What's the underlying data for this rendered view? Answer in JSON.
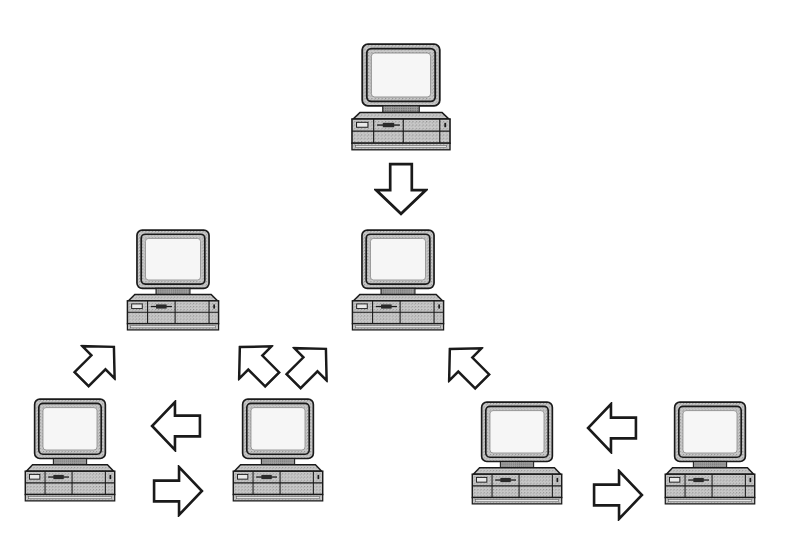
{
  "diagram": {
    "type": "hierarchical-network",
    "colors": {
      "stroke": "#1a1a1a",
      "casing": "#b8b8b8",
      "casing_dark": "#8c8c8c",
      "screen": "#f4f4f4",
      "background": "#ffffff"
    },
    "nodes": [
      {
        "id": "top",
        "x": 344,
        "y": 42,
        "w": 114,
        "h": 110,
        "icon": "computer-icon"
      },
      {
        "id": "mid-left",
        "x": 120,
        "y": 228,
        "w": 106,
        "h": 104,
        "icon": "computer-icon"
      },
      {
        "id": "mid-center",
        "x": 345,
        "y": 228,
        "w": 106,
        "h": 104,
        "icon": "computer-icon"
      },
      {
        "id": "bot-1",
        "x": 18,
        "y": 397,
        "w": 104,
        "h": 106,
        "icon": "computer-icon"
      },
      {
        "id": "bot-2",
        "x": 226,
        "y": 397,
        "w": 104,
        "h": 106,
        "icon": "computer-icon"
      },
      {
        "id": "bot-3",
        "x": 465,
        "y": 400,
        "w": 104,
        "h": 106,
        "icon": "computer-icon"
      },
      {
        "id": "bot-4",
        "x": 658,
        "y": 400,
        "w": 104,
        "h": 106,
        "icon": "computer-icon"
      }
    ],
    "arrows": [
      {
        "id": "top-to-mid-center",
        "direction": "down",
        "x": 372,
        "y": 162,
        "w": 58,
        "h": 54
      },
      {
        "id": "bot1-to-mid-left",
        "direction": "up-right",
        "x": 70,
        "y": 338,
        "w": 56,
        "h": 50
      },
      {
        "id": "bot2-to-mid-left",
        "direction": "up-left",
        "x": 230,
        "y": 338,
        "w": 56,
        "h": 50
      },
      {
        "id": "bot2-to-mid-center",
        "direction": "up-right",
        "x": 284,
        "y": 340,
        "w": 56,
        "h": 50
      },
      {
        "id": "bot3-to-mid-center",
        "direction": "up-left",
        "x": 440,
        "y": 340,
        "w": 56,
        "h": 50
      },
      {
        "id": "bot2-to-bot1",
        "direction": "left",
        "x": 150,
        "y": 400,
        "w": 52,
        "h": 52
      },
      {
        "id": "bot1-to-bot2",
        "direction": "right",
        "x": 152,
        "y": 464,
        "w": 52,
        "h": 52
      },
      {
        "id": "bot4-to-bot3",
        "direction": "left",
        "x": 586,
        "y": 402,
        "w": 52,
        "h": 52
      },
      {
        "id": "bot3-to-bot4",
        "direction": "right",
        "x": 592,
        "y": 468,
        "w": 52,
        "h": 52
      }
    ],
    "labels": []
  }
}
